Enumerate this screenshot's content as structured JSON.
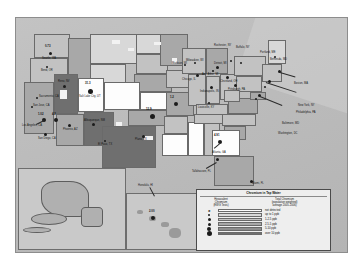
{
  "map": {
    "title": "Chromium in Tap Water",
    "legend": {
      "title": "Chromium in Tap Water",
      "col_left": "Hexavalent Chromium (EWG Tests)",
      "col_left_lines": [
        "Hexavalent",
        "Chromium",
        "(EWG Tests)"
      ],
      "col_right": "Total Chromium (population weighted) average 2005-2006",
      "col_right_lines": [
        "Total Chromium",
        "(population weighted)",
        "average 2005-2006)"
      ],
      "entries": [
        {
          "label": "not detected",
          "dot": "x",
          "swatch": "#fdfdfd"
        },
        {
          "label": "up to 1 ppb",
          "dot": "small",
          "swatch": "#d8d8d8"
        },
        {
          "label": "1-2.5 ppb",
          "dot": "small",
          "swatch": "#c2c2c2"
        },
        {
          "label": "2.5-5 ppb",
          "dot": "medium",
          "swatch": "#a8a8a8"
        },
        {
          "label": "5-10 ppb",
          "dot": "large",
          "swatch": "#8e8e8e"
        },
        {
          "label": "over 10 ppb",
          "dot": "xlarge",
          "swatch": "#6f6f6f"
        }
      ]
    },
    "cities": [
      {
        "name": "Seattle, WA",
        "value": "0.73",
        "x": 34,
        "y": 32
      },
      {
        "name": "Bend, OR",
        "value": "",
        "x": 30,
        "y": 47
      },
      {
        "name": "Reno, NV",
        "value": "",
        "x": 47,
        "y": 66
      },
      {
        "name": "Salt Lake City, UT",
        "value": "31.3",
        "x": 76,
        "y": 68
      },
      {
        "name": "Sacramento, CA",
        "value": "",
        "x": 22,
        "y": 78
      },
      {
        "name": "San Jose, CA",
        "value": "",
        "x": 18,
        "y": 88
      },
      {
        "name": "Los Angeles, CA",
        "value": "1.02",
        "x": 16,
        "y": 106
      },
      {
        "name": "Riverside, CA",
        "value": "4.2",
        "x": 34,
        "y": 104
      },
      {
        "name": "San Diego, CA",
        "value": "",
        "x": 24,
        "y": 118
      },
      {
        "name": "Phoenix, AZ",
        "value": "",
        "x": 57,
        "y": 100
      },
      {
        "name": "Albuquerque, NM",
        "value": "",
        "x": 79,
        "y": 113
      },
      {
        "name": "El Paso, TX",
        "value": "",
        "x": 88,
        "y": 122
      },
      {
        "name": "Norman, OK",
        "value": "12.9",
        "x": 130,
        "y": 90
      },
      {
        "name": "Plano, TX",
        "value": "",
        "x": 121,
        "y": 122
      },
      {
        "name": "Madison, WI",
        "value": "",
        "x": 159,
        "y": 65
      },
      {
        "name": "Chicago, IL",
        "value": "",
        "x": 168,
        "y": 78
      },
      {
        "name": "Milwaukee, WI",
        "value": "",
        "x": 171,
        "y": 70
      },
      {
        "name": "Indianapolis, IN",
        "value": "",
        "x": 182,
        "y": 82
      },
      {
        "name": "Louisville, KY",
        "value": "",
        "x": 186,
        "y": 92
      },
      {
        "name": "Detroit, MI",
        "value": "",
        "x": 196,
        "y": 66
      },
      {
        "name": "Ann Arbor, MI",
        "value": "",
        "x": 190,
        "y": 70
      },
      {
        "name": "Cleveland, OH",
        "value": "",
        "x": 206,
        "y": 72
      },
      {
        "name": "Pittsburgh, PA",
        "value": "",
        "x": 216,
        "y": 78
      },
      {
        "name": "Buffalo, NY",
        "value": "",
        "x": 224,
        "y": 55
      },
      {
        "name": "Rochester, NY",
        "value": "",
        "x": 216,
        "y": 50
      },
      {
        "name": "Portland, ME",
        "value": "",
        "x": 256,
        "y": 52
      },
      {
        "name": "Boston, MA",
        "value": "",
        "x": 262,
        "y": 70
      },
      {
        "name": "New York, NY",
        "value": "",
        "x": 252,
        "y": 86
      },
      {
        "name": "Philadelphia, PA",
        "value": "",
        "x": 250,
        "y": 93
      },
      {
        "name": "Baltimore, MD",
        "value": "",
        "x": 244,
        "y": 102
      },
      {
        "name": "Washington, DC",
        "value": "",
        "x": 243,
        "y": 110
      },
      {
        "name": "Bethesda, MD",
        "value": "",
        "x": 240,
        "y": 117
      },
      {
        "name": "Atlanta, GA",
        "value": "4.91",
        "x": 206,
        "y": 118
      },
      {
        "name": "Tallahassee, FL",
        "value": "",
        "x": 202,
        "y": 147
      },
      {
        "name": "Miami, FL",
        "value": "",
        "x": 234,
        "y": 163
      },
      {
        "name": "Honolulu, HI",
        "value": "2.00",
        "x": 132,
        "y": 181
      },
      {
        "name": "Missouri, MO",
        "value": "1.2",
        "x": 150,
        "y": 100
      }
    ]
  }
}
